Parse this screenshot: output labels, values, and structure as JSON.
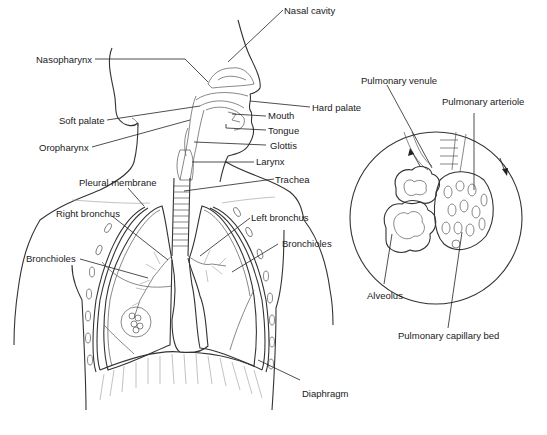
{
  "diagram": {
    "labels": {
      "nasal_cavity": "Nasal cavity",
      "nasopharynx": "Nasopharynx",
      "hard_palate": "Hard palate",
      "soft_palate": "Soft palate",
      "mouth": "Mouth",
      "tongue": "Tongue",
      "oropharynx": "Oropharynx",
      "glottis": "Glottis",
      "larynx": "Larynx",
      "trachea": "Trachea",
      "pleural_membrane": "Pleural membrane",
      "right_bronchus": "Right bronchus",
      "left_bronchus": "Left bronchus",
      "bronchioles_left_label": "Bronchioles",
      "bronchioles_right_label": "Bronchioles",
      "diaphragm": "Diaphragm"
    },
    "inset": {
      "labels": {
        "pulmonary_venule": "Pulmonary venule",
        "pulmonary_arteriole": "Pulmonary arteriole",
        "alveolus": "Alveolus",
        "pulmonary_capillary_bed": "Pulmonary capillary bed"
      }
    },
    "colors": {
      "line": "#222222",
      "background": "#ffffff",
      "text": "#1a1a1a"
    }
  }
}
